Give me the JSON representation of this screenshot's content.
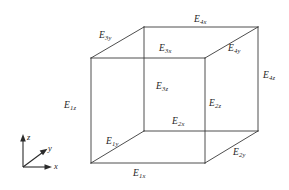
{
  "figure": {
    "type": "cube-wireframe-edge-labeling",
    "background_color": "#ffffff",
    "line_color": "#3a3a3a",
    "text_color": "#1d1d1d"
  },
  "axes": {
    "origin_label": "",
    "x": {
      "symbol": "x",
      "sub": ""
    },
    "y": {
      "symbol": "y",
      "sub": ""
    },
    "z": {
      "symbol": "z",
      "sub": ""
    }
  },
  "edge_labels": [
    {
      "id": "E1x",
      "symbol": "E",
      "sub": "1x",
      "position": "bottom-front-horizontal"
    },
    {
      "id": "E1y",
      "symbol": "E",
      "sub": "1y",
      "position": "bottom-left-depth-diagonal"
    },
    {
      "id": "E1z",
      "symbol": "E",
      "sub": "1z",
      "position": "front-left-vertical"
    },
    {
      "id": "E2x",
      "symbol": "E",
      "sub": "2x",
      "position": "mid-right-horizontal"
    },
    {
      "id": "E2y",
      "symbol": "E",
      "sub": "2y",
      "position": "bottom-right-depth-diagonal"
    },
    {
      "id": "E2z",
      "symbol": "E",
      "sub": "2z",
      "position": "inner-right-vertical-lower"
    },
    {
      "id": "E3x",
      "symbol": "E",
      "sub": "3x",
      "position": "inner-top-horizontal"
    },
    {
      "id": "E3y",
      "symbol": "E",
      "sub": "3y",
      "position": "top-left-depth-diagonal"
    },
    {
      "id": "E3z",
      "symbol": "E",
      "sub": "3z",
      "position": "inner-left-vertical"
    },
    {
      "id": "E4x",
      "symbol": "E",
      "sub": "4x",
      "position": "top-back-horizontal"
    },
    {
      "id": "E4y",
      "symbol": "E",
      "sub": "4y",
      "position": "top-right-depth-diagonal"
    },
    {
      "id": "E4z",
      "symbol": "E",
      "sub": "4z",
      "position": "back-right-vertical"
    }
  ]
}
